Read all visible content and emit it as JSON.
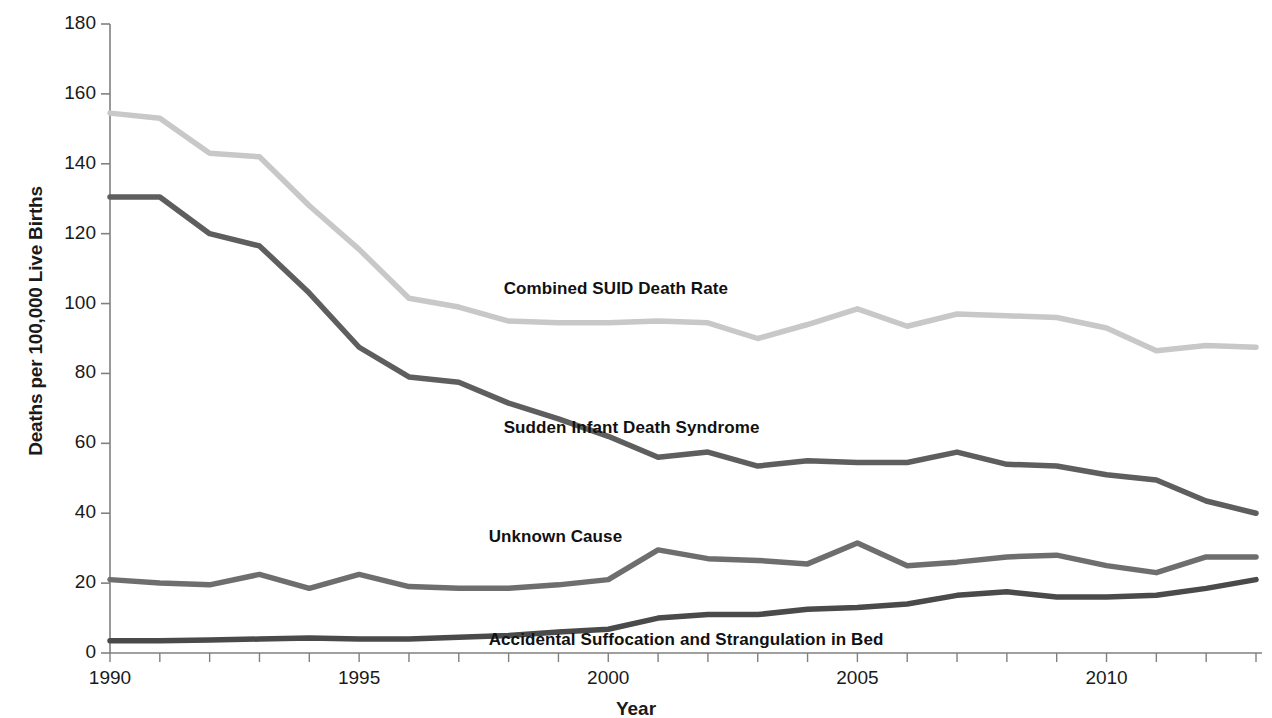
{
  "chart_data": {
    "type": "line",
    "title": "",
    "xlabel": "Year",
    "ylabel": "Deaths per 100,000 Live Births",
    "xlim": [
      1990,
      2013
    ],
    "ylim": [
      0,
      180
    ],
    "ytick_step": 20,
    "grid": false,
    "legend_position": "inline-annotations",
    "x": [
      1990,
      1991,
      1992,
      1993,
      1994,
      1995,
      1996,
      1997,
      1998,
      1999,
      2000,
      2001,
      2002,
      2003,
      2004,
      2005,
      2006,
      2007,
      2008,
      2009,
      2010,
      2011,
      2012,
      2013
    ],
    "xticks": [
      "1990",
      "1995",
      "2000",
      "2005",
      "2010"
    ],
    "xtick_values": [
      1990,
      1995,
      2000,
      2005,
      2010
    ],
    "yticks": [
      "0",
      "20",
      "40",
      "60",
      "80",
      "100",
      "120",
      "140",
      "160",
      "180"
    ],
    "ytick_values": [
      0,
      20,
      40,
      60,
      80,
      100,
      120,
      140,
      160,
      180
    ],
    "series": [
      {
        "name": "Combined SUID Death Rate",
        "color": "#c8c8c8",
        "label_x": 1997.9,
        "label_y": 104,
        "values": [
          154.5,
          153.0,
          143.0,
          142.0,
          128.0,
          115.5,
          101.5,
          99.0,
          95.0,
          94.5,
          94.5,
          95.0,
          94.5,
          90.0,
          94.0,
          98.5,
          93.5,
          97.0,
          96.5,
          96.0,
          93.0,
          86.5,
          88.0,
          87.5
        ]
      },
      {
        "name": "Sudden Infant Death Syndrome",
        "color": "#5e5e5e",
        "label_x": 1997.9,
        "label_y": 64,
        "values": [
          130.5,
          130.5,
          120.0,
          116.5,
          103.0,
          87.5,
          79.0,
          77.5,
          71.5,
          67.0,
          62.0,
          56.0,
          57.5,
          53.5,
          55.0,
          54.5,
          54.5,
          57.5,
          54.0,
          53.5,
          51.0,
          49.5,
          43.5,
          40.0
        ]
      },
      {
        "name": "Unknown Cause",
        "color": "#6e6e6e",
        "label_x": 1997.6,
        "label_y": 33,
        "values": [
          21.0,
          20.0,
          19.5,
          22.5,
          18.5,
          22.5,
          19.0,
          18.5,
          18.5,
          19.5,
          21.0,
          29.5,
          27.0,
          26.5,
          25.5,
          31.5,
          25.0,
          26.0,
          27.5,
          28.0,
          25.0,
          23.0,
          27.5,
          27.5
        ]
      },
      {
        "name": "Accidental Suffocation and Strangulation in Bed",
        "color": "#4a4a4a",
        "label_x": 1997.6,
        "label_y": 3.5,
        "values": [
          3.5,
          3.5,
          3.7,
          4.0,
          4.3,
          4.0,
          4.0,
          4.5,
          5.0,
          6.0,
          6.8,
          10.0,
          11.0,
          11.0,
          12.5,
          13.0,
          14.0,
          16.5,
          17.5,
          16.0,
          16.0,
          16.5,
          18.5,
          21.0
        ]
      }
    ]
  },
  "axis": {
    "y_title": "Deaths per 100,000 Live Births",
    "x_title": "Year"
  }
}
